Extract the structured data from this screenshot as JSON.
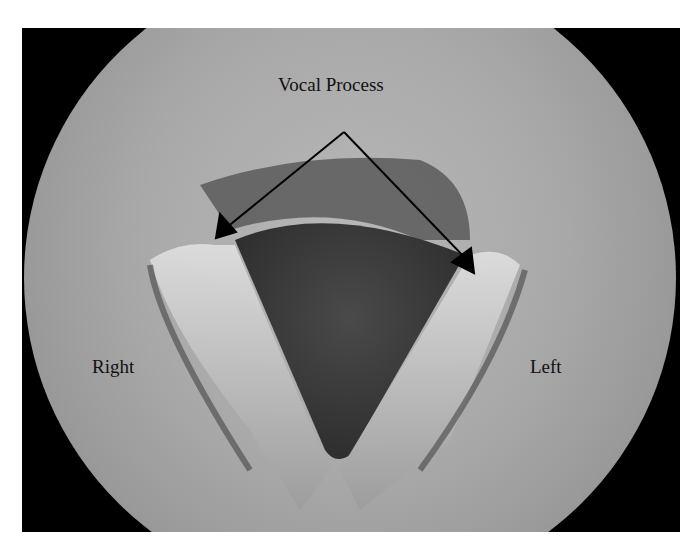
{
  "figure": {
    "labels": {
      "top": "Vocal Process",
      "right_side": "Right",
      "left_side": "Left"
    },
    "annotation": {
      "arrow_origin": [
        344,
        132
      ],
      "arrow_targets": [
        [
          216,
          238
        ],
        [
          474,
          273
        ]
      ]
    },
    "colors": {
      "background": "#ffffff",
      "frame": "#000000",
      "tissue": "#a9a9a9",
      "glottis": "#3e3e3e",
      "arrow": "#000000"
    }
  }
}
